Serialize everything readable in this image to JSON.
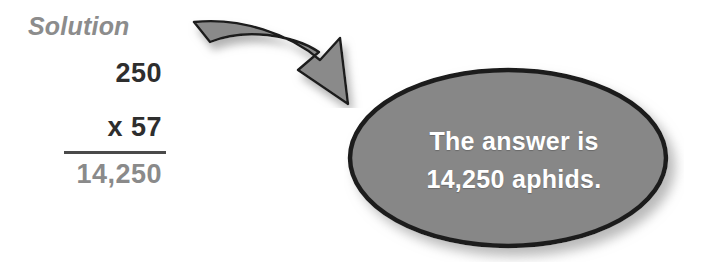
{
  "background_color": "#ffffff",
  "solution": {
    "heading": "Solution",
    "heading_color": "#8c8c8c",
    "multiplicand": "250",
    "multiplier": "x 57",
    "product": "14,250",
    "operand_color": "#2e2e2e",
    "product_color": "#8a8a8a",
    "rule_color": "#4a4a4a"
  },
  "arrow": {
    "icon": "curved-arrow-icon",
    "direction": "down-right",
    "fill_color": "#8a8a8a",
    "outline_color": "#1c1c1c",
    "shadow_color": "#b4b4b4"
  },
  "callout": {
    "shape": "ellipse",
    "fill_color": "#878787",
    "outline_color": "#1e1e1e",
    "text_color": "#ffffff",
    "shadow_color": "#bdbdbd",
    "lines": [
      "The answer is",
      "14,250 aphids."
    ]
  }
}
